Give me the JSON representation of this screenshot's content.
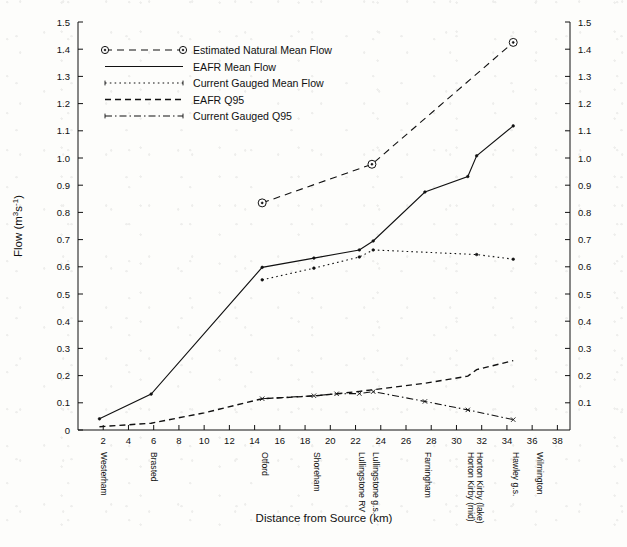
{
  "chart_data": {
    "type": "line",
    "title": "",
    "xlabel": "Distance from Source (km)",
    "ylabel": "Flow (m³s⁻¹)",
    "xlim": [
      0,
      39
    ],
    "ylim": [
      0,
      1.5
    ],
    "grid": false,
    "legend_position": "top-left",
    "x_ticks": [
      2,
      4,
      6,
      8,
      10,
      12,
      14,
      16,
      18,
      20,
      22,
      24,
      26,
      28,
      30,
      32,
      34,
      36,
      38
    ],
    "y_ticks": [
      "0",
      "0.1",
      "0.2",
      "0.3",
      "0.4",
      "0.5",
      "0.6",
      "0.7",
      "0.8",
      "0.9",
      "1.0",
      "1.1",
      "1.2",
      "1.3",
      "1.4",
      "1.5"
    ],
    "y_ticks_right": [
      "0.1",
      "0.2",
      "0.3",
      "0.4",
      "0.5",
      "0.6",
      "0.7",
      "0.8",
      "0.9",
      "1.0",
      "1.1",
      "1.2",
      "1.3",
      "1.4",
      "1.5"
    ],
    "category_markers": [
      {
        "label": "Westerham",
        "x": 1.8
      },
      {
        "label": "Brasted",
        "x": 5.8
      },
      {
        "label": "Otford",
        "x": 14.6
      },
      {
        "label": "Shoreham",
        "x": 18.7
      },
      {
        "label": "Lullingstone RV",
        "x": 22.3
      },
      {
        "label": "Lullingstone g.s.",
        "x": 23.4
      },
      {
        "label": "Farningham",
        "x": 27.5
      },
      {
        "label": "Horton Kirby (mid)",
        "x": 30.9
      },
      {
        "label": "Horton Kirby (lake)",
        "x": 31.6
      },
      {
        "label": "Hawley g.s.",
        "x": 34.5
      },
      {
        "label": "Wilmington",
        "x": 36.4
      }
    ],
    "series": [
      {
        "name": "Estimated Natural Mean Flow",
        "style": "dashed-long",
        "marker": "circle-dot",
        "x": [
          14.6,
          23.3,
          34.5
        ],
        "values": [
          0.835,
          0.977,
          1.425
        ]
      },
      {
        "name": "EAFR Mean Flow",
        "style": "solid",
        "marker": "dot",
        "x": [
          1.7,
          5.8,
          14.6,
          18.7,
          22.3,
          23.4,
          27.5,
          30.9,
          31.6,
          34.5
        ],
        "values": [
          0.041,
          0.132,
          0.598,
          0.632,
          0.662,
          0.695,
          0.875,
          0.932,
          1.008,
          1.118
        ]
      },
      {
        "name": "Current Gauged Mean Flow",
        "style": "dotted",
        "marker": "dot",
        "x": [
          14.6,
          18.7,
          22.3,
          23.4,
          31.6,
          34.5
        ],
        "values": [
          0.552,
          0.595,
          0.636,
          0.662,
          0.645,
          0.628
        ]
      },
      {
        "name": "EAFR Q95",
        "style": "dashed",
        "marker": "none",
        "x": [
          1.7,
          5.8,
          10.0,
          14.6,
          18.7,
          22.3,
          23.4,
          27.5,
          30.9,
          31.6,
          34.5
        ],
        "values": [
          0.012,
          0.025,
          0.063,
          0.115,
          0.125,
          0.142,
          0.148,
          0.172,
          0.198,
          0.222,
          0.255
        ]
      },
      {
        "name": "Current Gauged Q95",
        "style": "dash-dot",
        "marker": "x",
        "x": [
          14.6,
          18.7,
          20.5,
          22.3,
          23.4,
          27.5,
          30.9,
          34.5
        ],
        "values": [
          0.115,
          0.126,
          0.133,
          0.134,
          0.141,
          0.105,
          0.074,
          0.038
        ]
      }
    ],
    "legend": [
      {
        "label": "Estimated Natural Mean Flow",
        "style": "dashed-long",
        "marker": "circle-dot"
      },
      {
        "label": "EAFR Mean Flow",
        "style": "solid",
        "marker": "none"
      },
      {
        "label": "Current Gauged Mean Flow",
        "style": "dotted",
        "marker": "tick"
      },
      {
        "label": "EAFR Q95",
        "style": "dashed",
        "marker": "none"
      },
      {
        "label": "Current Gauged Q95",
        "style": "dash-dot",
        "marker": "tick"
      }
    ]
  }
}
